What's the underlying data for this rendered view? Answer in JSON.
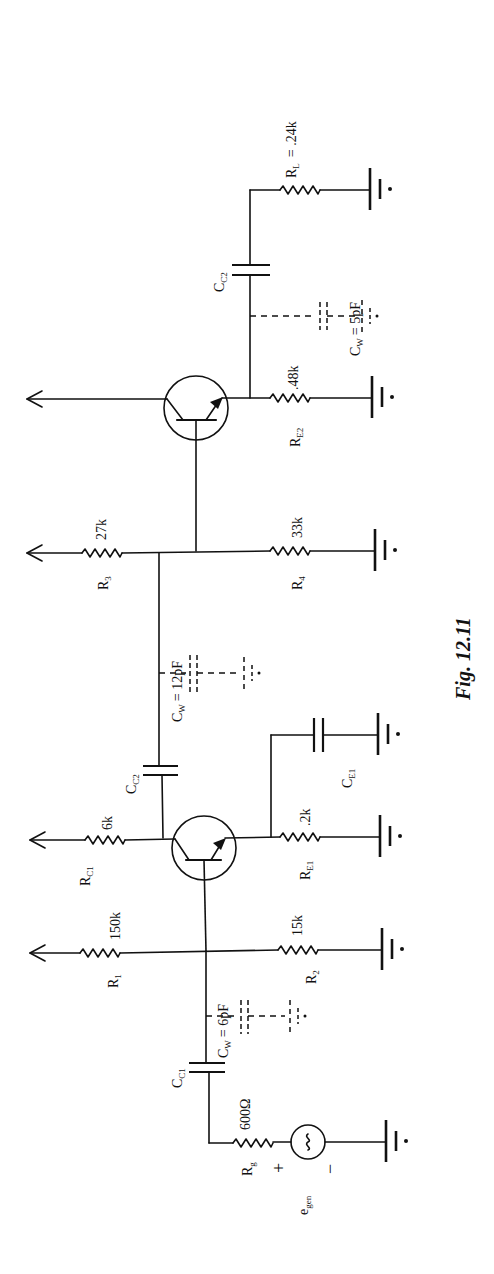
{
  "figure": {
    "caption": "Fig. 12.11",
    "orientation": "rotated 90° counter-clockwise",
    "stroke_color": "#111111",
    "background_color": "#ffffff"
  },
  "components": {
    "source": {
      "name": "e",
      "sub": "gen",
      "plus": "+",
      "minus": "−",
      "symbol": "~"
    },
    "rg": {
      "name": "R",
      "sub": "g",
      "value": "600Ω"
    },
    "cc1": {
      "name": "C",
      "sub": "C1"
    },
    "cw1": {
      "name": "C",
      "sub": "W",
      "value": "= 6pF"
    },
    "r1": {
      "name": "R",
      "sub": "1",
      "value": "150k"
    },
    "r2": {
      "name": "R",
      "sub": "2",
      "value": "15k"
    },
    "rc1": {
      "name": "R",
      "sub": "C1",
      "value": "6k"
    },
    "re1": {
      "name": "R",
      "sub": "E1",
      "value": ".2k"
    },
    "ce1": {
      "name": "C",
      "sub": "E1"
    },
    "cc2a": {
      "name": "C",
      "sub": "C2"
    },
    "cw2": {
      "name": "C",
      "sub": "W",
      "value": "= 12pF"
    },
    "r3": {
      "name": "R",
      "sub": "3",
      "value": "27k"
    },
    "r4": {
      "name": "R",
      "sub": "4",
      "value": "33k"
    },
    "re2": {
      "name": "R",
      "sub": "E2",
      "value": ".48k"
    },
    "cw3": {
      "name": "C",
      "sub": "W",
      "value": "= 5pF"
    },
    "cc2b": {
      "name": "C",
      "sub": "C2"
    },
    "rl": {
      "name": "R",
      "sub": "L",
      "value": "= .24k"
    }
  },
  "transistors": [
    {
      "id": "Q1",
      "type": "NPN"
    },
    {
      "id": "Q2",
      "type": "NPN"
    }
  ]
}
